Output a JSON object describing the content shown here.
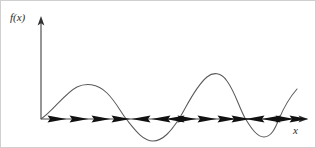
{
  "figure": {
    "title": "",
    "background_color": "#ffffff",
    "border_color": "#cfcfcf",
    "width": 316,
    "height": 148
  },
  "labels": {
    "y_axis": "f(x)",
    "x_axis": "x"
  },
  "chart_data": {
    "type": "line",
    "title": "",
    "xlabel": "x",
    "ylabel": "f(x)",
    "grid": false,
    "legend": "none",
    "axes": {
      "origin_px": [
        40,
        118
      ],
      "x_axis_y_px": 118,
      "y_axis_x_px": 40,
      "x_axis_end_px": 305,
      "y_axis_top_px": 18,
      "x_arrowhead": "right",
      "y_arrowhead": "up",
      "tick_labels_x": [],
      "tick_labels_y": [],
      "xlim_px": [
        40,
        305
      ],
      "ylim_px": [
        18,
        148
      ]
    },
    "curve": {
      "description": "oscillating function crossing the x-axis four times, with two positive humps and two negative troughs, ending in a steep rise",
      "path": "M 40 118 C 52 110, 64 92, 76 86 C 84 82, 96 82, 106 92 C 116 102, 120 112, 126 119 C 134 129, 142 140, 152 140 C 162 140, 170 130, 178 118 C 186 105, 194 86, 206 76 C 212 71, 220 71, 226 80 C 234 91, 238 106, 244 117 C 250 127, 256 136, 263 136 C 270 136, 274 128, 278 118 C 283 106, 289 96, 296 88",
      "zero_crossings_px": [
        40,
        126,
        178,
        244,
        278
      ],
      "extrema_px": [
        {
          "kind": "maximum",
          "x": 88,
          "y": 84
        },
        {
          "kind": "minimum",
          "x": 152,
          "y": 140
        },
        {
          "kind": "maximum",
          "x": 215,
          "y": 73
        },
        {
          "kind": "minimum",
          "x": 263,
          "y": 136
        }
      ],
      "end_point_px": [
        296,
        88
      ]
    },
    "flow_arrows": {
      "description": "phase-line direction markers on the x-axis; point right where f(x) > 0 and left where f(x) < 0",
      "y_px": 118,
      "markers": [
        {
          "x": 56,
          "direction": "right"
        },
        {
          "x": 78,
          "direction": "right"
        },
        {
          "x": 100,
          "direction": "right"
        },
        {
          "x": 120,
          "direction": "right"
        },
        {
          "x": 140,
          "direction": "left"
        },
        {
          "x": 160,
          "direction": "left"
        },
        {
          "x": 174,
          "direction": "left"
        },
        {
          "x": 186,
          "direction": "right"
        },
        {
          "x": 206,
          "direction": "right"
        },
        {
          "x": 226,
          "direction": "right"
        },
        {
          "x": 240,
          "direction": "right"
        },
        {
          "x": 254,
          "direction": "left"
        },
        {
          "x": 270,
          "direction": "left"
        },
        {
          "x": 284,
          "direction": "right"
        },
        {
          "x": 298,
          "direction": "right"
        }
      ]
    },
    "colors": {
      "curve": "#5a5a5a",
      "axis": "#4a4a4a",
      "arrow": "#111111",
      "label": "#2b2b2b"
    }
  }
}
